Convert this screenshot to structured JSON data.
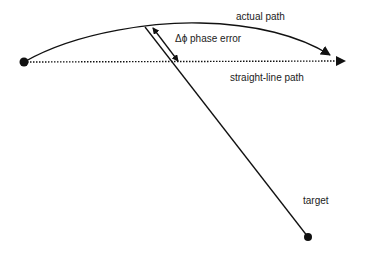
{
  "diagram": {
    "type": "phase-error-geometry",
    "labels": {
      "actual_path": "actual path",
      "phase_error": "Δϕ phase error",
      "straight_line_path": "straight-line path",
      "target": "target"
    },
    "nodes": [
      {
        "id": "origin",
        "shape": "filled-circle",
        "x": 24,
        "y": 62
      },
      {
        "id": "target",
        "shape": "filled-circle",
        "x": 308,
        "y": 237,
        "label": "target"
      }
    ],
    "edges": [
      {
        "id": "actual-path",
        "style": "solid-curved",
        "from": "origin",
        "arrowhead": "end",
        "label": "actual path"
      },
      {
        "id": "straight-line-path",
        "style": "dotted",
        "from": "origin",
        "arrowhead": "end",
        "label": "straight-line path"
      },
      {
        "id": "target-line",
        "style": "solid",
        "to": "target"
      },
      {
        "id": "phase-error-arrow",
        "style": "double-headed",
        "label": "Δϕ phase error"
      }
    ],
    "colors": {
      "stroke": "#111111",
      "text": "#222222",
      "background": "#ffffff"
    }
  }
}
